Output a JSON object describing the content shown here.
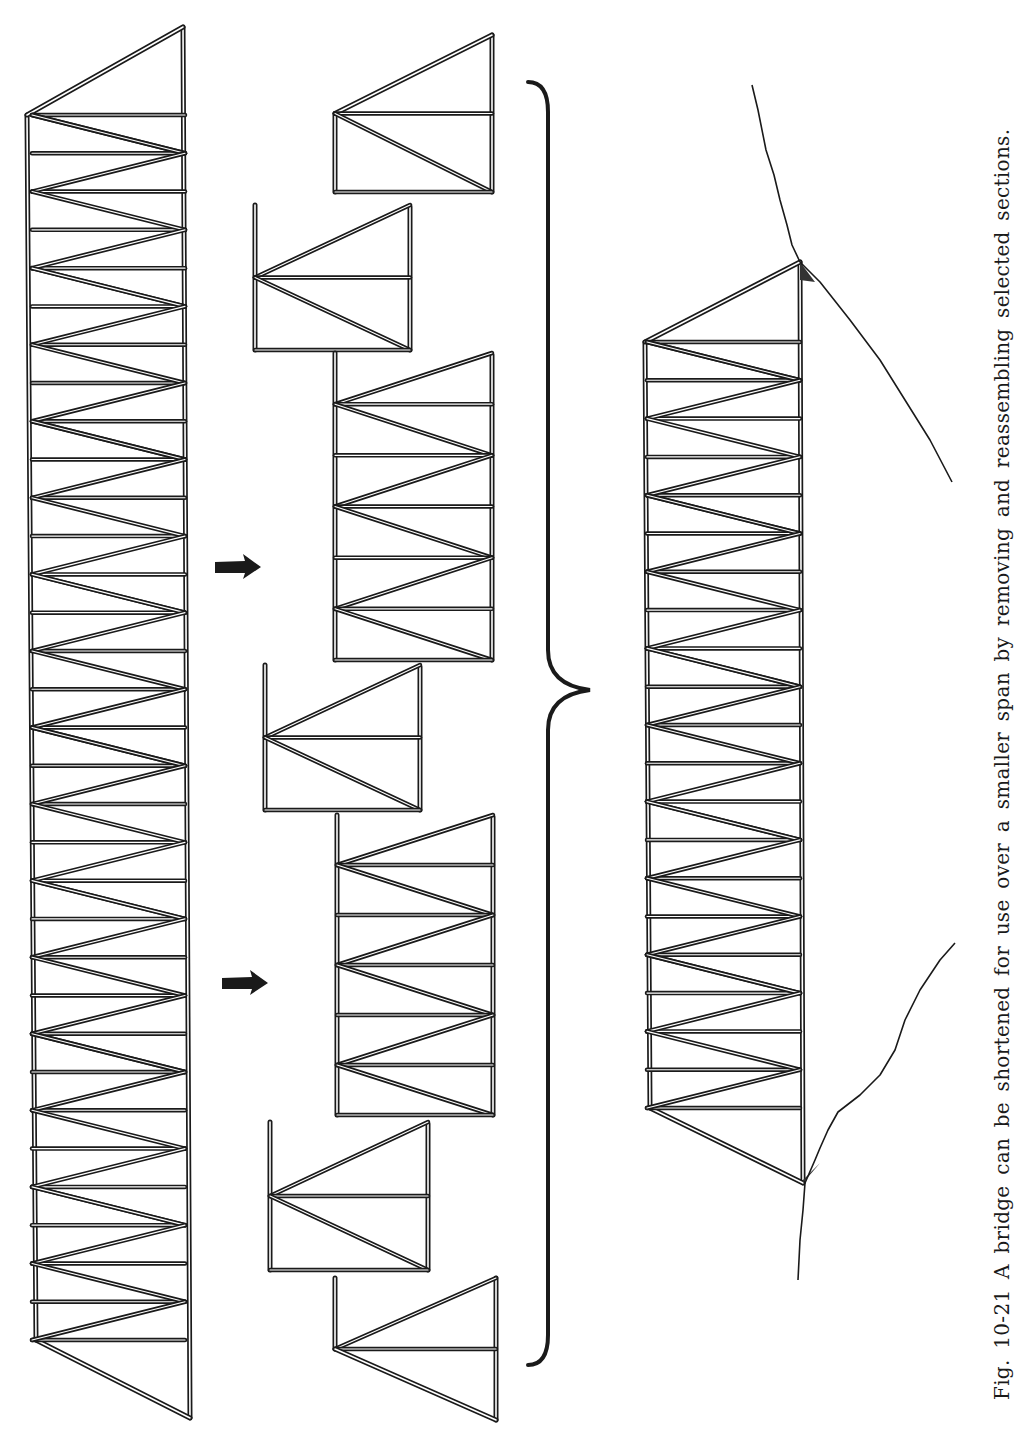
{
  "figure": {
    "number": "Fig. 10-21",
    "caption": "Fig. 10-21 A bridge can be shortened for use over a smaller span by removing and reassembling selected sections.",
    "orientation": "rotated-90-ccw",
    "colors": {
      "ink": "#1a1a1a",
      "paper": "#ffffff"
    }
  },
  "long_truss": {
    "label": "original-full-length-truss",
    "left_chord_x": 30,
    "right_chord_x": 185,
    "top_apex": [
      183,
      27
    ],
    "top_left": [
      27,
      115
    ],
    "bottom_apex": [
      190,
      1418
    ],
    "bottom_left": [
      36,
      1340
    ],
    "panel_pitch": 76.5,
    "panels": 17
  },
  "sections": [
    {
      "name": "end-section-top",
      "x0": 335,
      "x1": 492,
      "y0": 35,
      "y1": 192,
      "kind": "end-top",
      "panels": 1
    },
    {
      "name": "removed-section-1",
      "x0": 255,
      "x1": 410,
      "y0": 205,
      "y1": 350,
      "kind": "single",
      "panels": 1
    },
    {
      "name": "middle-section-1",
      "x0": 335,
      "x1": 492,
      "y0": 353,
      "y1": 660,
      "kind": "multi",
      "panels": 3
    },
    {
      "name": "removed-section-2",
      "x0": 265,
      "x1": 420,
      "y0": 665,
      "y1": 810,
      "kind": "single",
      "panels": 1
    },
    {
      "name": "middle-section-2",
      "x0": 337,
      "x1": 493,
      "y0": 815,
      "y1": 1115,
      "kind": "multi",
      "panels": 3
    },
    {
      "name": "removed-section-3",
      "x0": 270,
      "x1": 428,
      "y0": 1122,
      "y1": 1270,
      "kind": "single",
      "panels": 1
    },
    {
      "name": "end-section-bottom",
      "x0": 335,
      "x1": 496,
      "y0": 1278,
      "y1": 1420,
      "kind": "end-bottom",
      "panels": 1
    }
  ],
  "arrows": [
    {
      "name": "remove-arrow-1",
      "x": 215,
      "y": 567
    },
    {
      "name": "remove-arrow-2",
      "x": 222,
      "y": 983
    }
  ],
  "brace": {
    "x": 548,
    "top": 82,
    "bottom": 1365,
    "tip_x": 590,
    "tip_y": 690
  },
  "reassembled_bridge": {
    "label": "shortened-bridge",
    "left_chord_x": 645,
    "right_chord_x": 800,
    "top_apex": [
      800,
      262
    ],
    "top_left": [
      645,
      342
    ],
    "bottom_apex": [
      803,
      1183
    ],
    "bottom_left": [
      650,
      1108
    ],
    "panel_pitch": 76.6,
    "panels": 10
  },
  "terrain": {
    "upper_bank": [
      [
        752,
        85
      ],
      [
        758,
        110
      ],
      [
        766,
        150
      ],
      [
        774,
        175
      ],
      [
        780,
        200
      ],
      [
        787,
        225
      ],
      [
        792,
        245
      ],
      [
        800,
        262
      ],
      [
        820,
        282
      ],
      [
        850,
        320
      ],
      [
        880,
        360
      ],
      [
        905,
        400
      ],
      [
        930,
        440
      ],
      [
        952,
        482
      ]
    ],
    "lower_bank": [
      [
        955,
        943
      ],
      [
        940,
        960
      ],
      [
        920,
        990
      ],
      [
        905,
        1020
      ],
      [
        895,
        1050
      ],
      [
        880,
        1075
      ],
      [
        860,
        1095
      ],
      [
        838,
        1112
      ],
      [
        828,
        1130
      ],
      [
        820,
        1148
      ],
      [
        815,
        1160
      ],
      [
        805,
        1183
      ],
      [
        803,
        1210
      ],
      [
        800,
        1240
      ],
      [
        798,
        1280
      ]
    ]
  }
}
